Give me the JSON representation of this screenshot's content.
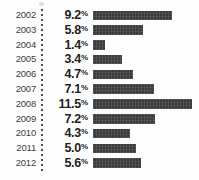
{
  "chart_data": {
    "type": "bar",
    "title": "",
    "subtitle": "",
    "xlabel": "",
    "ylabel": "",
    "orientation": "horizontal",
    "grid": false,
    "legend": false,
    "axis_visible": false,
    "value_suffix": "%",
    "xlim": [
      0,
      11.5
    ],
    "categories": [
      "2002",
      "2003",
      "2004",
      "2005",
      "2006",
      "2007",
      "2008",
      "2009",
      "2010",
      "2011",
      "2012"
    ],
    "values": [
      9.2,
      5.8,
      1.4,
      3.4,
      4.7,
      7.1,
      11.5,
      7.2,
      4.3,
      5.0,
      5.6
    ],
    "rows": [
      {
        "year": "2002",
        "value": "9.2",
        "suffix": "%",
        "num": 9.2
      },
      {
        "year": "2003",
        "value": "5.8",
        "suffix": "%",
        "num": 5.8
      },
      {
        "year": "2004",
        "value": "1.4",
        "suffix": "%",
        "num": 1.4
      },
      {
        "year": "2005",
        "value": "3.4",
        "suffix": "%",
        "num": 3.4
      },
      {
        "year": "2006",
        "value": "4.7",
        "suffix": "%",
        "num": 4.7
      },
      {
        "year": "2007",
        "value": "7.1",
        "suffix": "%",
        "num": 7.1
      },
      {
        "year": "2008",
        "value": "11.5",
        "suffix": "%",
        "num": 11.5
      },
      {
        "year": "2009",
        "value": "7.2",
        "suffix": "%",
        "num": 7.2
      },
      {
        "year": "2010",
        "value": "4.3",
        "suffix": "%",
        "num": 4.3
      },
      {
        "year": "2011",
        "value": "5.0",
        "suffix": "%",
        "num": 5.0
      },
      {
        "year": "2012",
        "value": "5.6",
        "suffix": "%",
        "num": 5.6
      }
    ]
  },
  "style": {
    "bar_color": "#3b3b3b",
    "value_color": "#1f1f1f",
    "year_color": "#3d3d3d",
    "background": "#fdfdfd",
    "divider_color": "#4a4a4a"
  },
  "layout": {
    "bar_origin_px": 93,
    "bar_max_px": 99,
    "bar_min_px": 12,
    "row_pitch_px": 14.8
  }
}
